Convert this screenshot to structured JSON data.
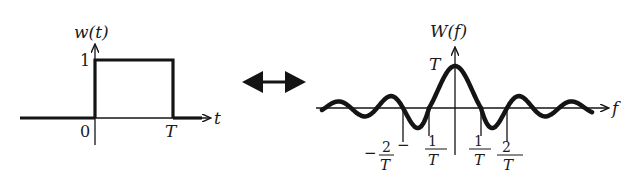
{
  "figure": {
    "colors": {
      "ink": "#141414",
      "background": "#ffffff"
    }
  },
  "left_plot": {
    "function_label": "w(t)",
    "x_axis_label": "t",
    "y_tick_label": "1",
    "x_tick_labels": {
      "origin": "0",
      "end": "T"
    }
  },
  "transform_arrow": {
    "symbol": "double-headed-arrow"
  },
  "right_plot": {
    "function_label": "W(f)",
    "x_axis_label": "f",
    "peak_label": "T",
    "x_tick_labels": [
      {
        "sign": "−",
        "numerator": "2",
        "denominator": "T"
      },
      {
        "sign": "−",
        "numerator": "1",
        "denominator": "T"
      },
      {
        "sign": "",
        "numerator": "1",
        "denominator": "T"
      },
      {
        "sign": "",
        "numerator": "2",
        "denominator": "T"
      }
    ]
  },
  "chart_data": [
    {
      "type": "line",
      "title": "w(t)",
      "xlabel": "t",
      "ylabel": "w(t)",
      "x": [
        "-inf",
        "0",
        "0",
        "T",
        "T",
        "+inf"
      ],
      "values": [
        0,
        0,
        1,
        1,
        0,
        0
      ],
      "x_ticks": [
        "0",
        "T"
      ],
      "y_ticks": [
        "1"
      ],
      "grid": false
    },
    {
      "type": "line",
      "title": "W(f)",
      "xlabel": "f",
      "ylabel": "W(f)",
      "shape": "sinc",
      "peak": {
        "f": 0,
        "value": "T"
      },
      "zero_crossings": [
        "-2/T",
        "-1/T",
        "1/T",
        "2/T"
      ],
      "x_ticks": [
        "-2/T",
        "-1/T",
        "1/T",
        "2/T"
      ],
      "y_ticks": [
        "T"
      ],
      "grid": false
    }
  ]
}
